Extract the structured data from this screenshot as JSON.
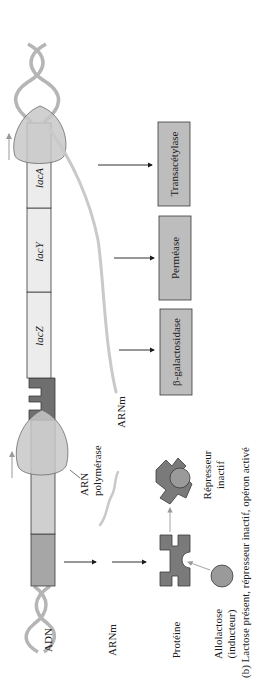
{
  "diagram": {
    "caption": "(b) Lactose présent, répresseur inactif, opéron activé",
    "row_labels": {
      "dna": "ADN",
      "mrna": "ARNm",
      "protein": "Protéine"
    },
    "inducer": {
      "line1": "Allolactose",
      "line2": "(inducteur)"
    },
    "rna_polymerase": {
      "line1": "ARN",
      "line2": "polymérase"
    },
    "operon_mrna_label": "ARNm",
    "inactive_repressor": {
      "line1": "Répresseur",
      "line2": "inactif"
    },
    "genes": [
      {
        "id": "lacZ",
        "label": "lacZ"
      },
      {
        "id": "lacY",
        "label": "lacY"
      },
      {
        "id": "lacA",
        "label": "lacA"
      }
    ],
    "proteins": [
      {
        "id": "beta-galactosidase",
        "label": "β-galactosidase"
      },
      {
        "id": "permease",
        "label": "Perméase"
      },
      {
        "id": "transacetylase",
        "label": "Transacétylase"
      }
    ],
    "colors": {
      "regulator_gene": "#a6a6a6",
      "promoter": "#cfcfcf",
      "operator": "#6f6f6f",
      "structural_gene": "#ececec",
      "protein_box": "#bdbdbd",
      "repressor": "#7a7a7a",
      "inducer": "#9a9a9a",
      "polymerase": "#c8c8c8",
      "helix": "#b5b5b5",
      "mrna": "#c9c9c9"
    }
  }
}
